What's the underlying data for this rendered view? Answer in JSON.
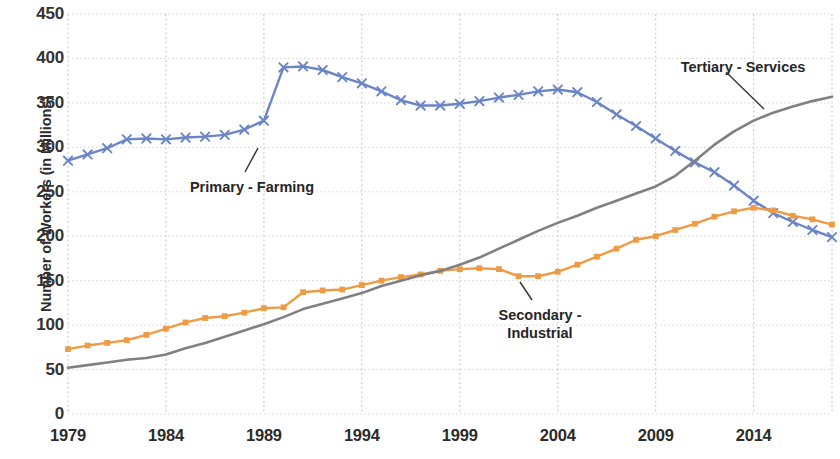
{
  "chart_data": {
    "type": "line",
    "title": "",
    "xlabel": "",
    "ylabel": "Number of Workers (in Millions)",
    "xlim": [
      1979,
      2018
    ],
    "ylim": [
      0,
      450
    ],
    "grid": true,
    "legend_position": "inline-annotations",
    "x_tick_labels": [
      "1979",
      "1984",
      "1989",
      "1994",
      "1999",
      "2004",
      "2009",
      "2014"
    ],
    "x_ticks": [
      1979,
      1984,
      1989,
      1994,
      1999,
      2004,
      2009,
      2014
    ],
    "y_tick_labels": [
      "0",
      "50",
      "100",
      "150",
      "200",
      "250",
      "300",
      "350",
      "400",
      "450"
    ],
    "y_ticks": [
      0,
      50,
      100,
      150,
      200,
      250,
      300,
      350,
      400,
      450
    ],
    "x": [
      1979,
      1980,
      1981,
      1982,
      1983,
      1984,
      1985,
      1986,
      1987,
      1988,
      1989,
      1990,
      1991,
      1992,
      1993,
      1994,
      1995,
      1996,
      1997,
      1998,
      1999,
      2000,
      2001,
      2002,
      2003,
      2004,
      2005,
      2006,
      2007,
      2008,
      2009,
      2010,
      2011,
      2012,
      2013,
      2014,
      2015,
      2016,
      2017,
      2018
    ],
    "series": [
      {
        "name": "Primary - Farming",
        "color": "#6A85C6",
        "marker": "x",
        "values": [
          285,
          292,
          299,
          309,
          310,
          309,
          311,
          312,
          314,
          320,
          330,
          390,
          391,
          387,
          379,
          372,
          363,
          353,
          347,
          347,
          349,
          352,
          356,
          359,
          363,
          365,
          362,
          351,
          337,
          324,
          310,
          296,
          283,
          272,
          257,
          240,
          226,
          216,
          207,
          199
        ]
      },
      {
        "name": "Secondary - Industrial",
        "color": "#ED9B45",
        "marker": "square",
        "values": [
          73,
          77,
          80,
          83,
          89,
          96,
          103,
          108,
          110,
          114,
          119,
          120,
          137,
          139,
          140,
          145,
          150,
          154,
          157,
          161,
          163,
          164,
          163,
          155,
          155,
          160,
          168,
          177,
          186,
          196,
          200,
          207,
          214,
          222,
          228,
          232,
          229,
          223,
          219,
          213
        ]
      },
      {
        "name": "Tertiary - Services",
        "color": "#808080",
        "marker": "none",
        "values": [
          52,
          55,
          58,
          61,
          63,
          67,
          74,
          80,
          87,
          94,
          101,
          109,
          118,
          124,
          130,
          136,
          144,
          150,
          156,
          161,
          168,
          176,
          186,
          196,
          206,
          215,
          223,
          232,
          240,
          248,
          256,
          268,
          285,
          303,
          318,
          330,
          339,
          346,
          352,
          357
        ]
      }
    ],
    "annotations": [
      {
        "text": "Primary - Farming",
        "series": "Primary - Farming"
      },
      {
        "text": "Secondary -\nIndustrial",
        "series": "Secondary - Industrial"
      },
      {
        "text": "Tertiary - Services",
        "series": "Tertiary - Services"
      }
    ]
  }
}
